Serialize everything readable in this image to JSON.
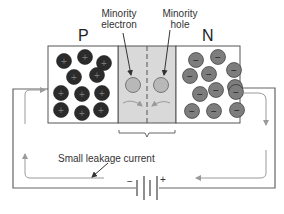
{
  "diagram": {
    "regions": {
      "p_label": "P",
      "n_label": "N"
    },
    "annotations": {
      "minority_electron": [
        "Minority",
        "electron"
      ],
      "minority_hole": [
        "Minority",
        "hole"
      ],
      "leakage_current": "Small leakage current"
    },
    "battery": {
      "negative_symbol": "−",
      "positive_symbol": "+"
    },
    "carrier_symbols": {
      "p_carrier": "+",
      "n_carrier": "−"
    },
    "colors": {
      "p_carrier": "#2b2b2b",
      "n_carrier": "#7d7d7d",
      "depletion": "#d9d9d9",
      "minority": "#b8b8b8",
      "wire": "#666666",
      "current_arrow": "#9a9a9a"
    },
    "p_carriers": [
      [
        64,
        61
      ],
      [
        85,
        57
      ],
      [
        104,
        63
      ],
      [
        74,
        77
      ],
      [
        97,
        75
      ],
      [
        61,
        93
      ],
      [
        82,
        94
      ],
      [
        102,
        93
      ],
      [
        61,
        110
      ],
      [
        82,
        113
      ],
      [
        101,
        110
      ]
    ],
    "n_carriers": [
      [
        196,
        60
      ],
      [
        218,
        57
      ],
      [
        234,
        70
      ],
      [
        190,
        76
      ],
      [
        209,
        74
      ],
      [
        235,
        87
      ],
      [
        200,
        94
      ],
      [
        216,
        90
      ],
      [
        236,
        92
      ],
      [
        192,
        111
      ],
      [
        214,
        111
      ],
      [
        237,
        110
      ]
    ]
  }
}
